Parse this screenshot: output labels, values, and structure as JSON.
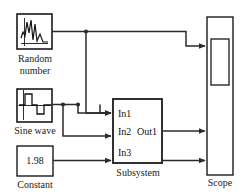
{
  "diagram": {
    "background_color": "#ffffff",
    "line_color": "#2b2b2b",
    "block_border_color": "#1a1a1a"
  },
  "blocks": {
    "random_number": {
      "label": "Random",
      "label_line2": "number",
      "icon": "random-noise-waveform-icon"
    },
    "sine_wave": {
      "label": "Sine wave",
      "icon": "pulse-waveform-icon"
    },
    "constant": {
      "label": "Constant",
      "value": "1.98"
    },
    "subsystem": {
      "label": "Subsystem",
      "in1": "In1",
      "in2": "In2",
      "out1": "Out1",
      "in3": "In3"
    },
    "scope": {
      "label": "Scope",
      "icon": "scope-display-icon"
    }
  },
  "signals": [
    {
      "name": "random-to-scope",
      "from": "random_number",
      "to": "scope"
    },
    {
      "name": "random-to-in2",
      "from": "random_number",
      "to": "subsystem.In2"
    },
    {
      "name": "sine-to-in1",
      "from": "sine_wave",
      "to": "subsystem.In1"
    },
    {
      "name": "sine-to-in2",
      "from": "sine_wave",
      "to": "subsystem.In2"
    },
    {
      "name": "constant-to-in3",
      "from": "constant",
      "to": "subsystem.In3"
    },
    {
      "name": "subsystem-out1-to-scope",
      "from": "subsystem.Out1",
      "to": "scope"
    }
  ]
}
